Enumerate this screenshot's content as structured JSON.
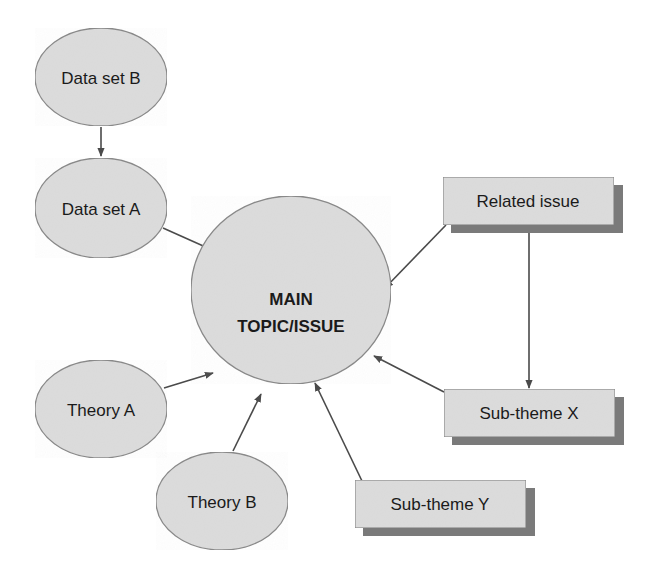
{
  "diagram": {
    "type": "concept-map",
    "colors": {
      "node_fill": "#dcdcdc",
      "node_stroke": "#8a8a8a",
      "shadow": "#7a7a7a",
      "arrow": "#4a4a4a",
      "text": "#1a1a1a"
    },
    "nodes": {
      "main": {
        "line1": "MAIN",
        "line2": "TOPIC/ISSUE",
        "shape": "ellipse"
      },
      "data_set_b": {
        "label": "Data set B",
        "shape": "ellipse"
      },
      "data_set_a": {
        "label": "Data set A",
        "shape": "ellipse"
      },
      "theory_a": {
        "label": "Theory A",
        "shape": "ellipse"
      },
      "theory_b": {
        "label": "Theory B",
        "shape": "ellipse"
      },
      "related_issue": {
        "label": "Related issue",
        "shape": "box"
      },
      "sub_theme_x": {
        "label": "Sub-theme X",
        "shape": "box"
      },
      "sub_theme_y": {
        "label": "Sub-theme Y",
        "shape": "box"
      }
    },
    "edges": [
      {
        "from": "Data set B",
        "to": "Data set A"
      },
      {
        "from": "Data set A",
        "to": "MAIN TOPIC/ISSUE"
      },
      {
        "from": "Related issue",
        "to": "MAIN TOPIC/ISSUE"
      },
      {
        "from": "Related issue",
        "to": "Sub-theme X"
      },
      {
        "from": "Sub-theme X",
        "to": "MAIN TOPIC/ISSUE"
      },
      {
        "from": "Sub-theme Y",
        "to": "MAIN TOPIC/ISSUE"
      },
      {
        "from": "Theory A",
        "to": "MAIN TOPIC/ISSUE"
      },
      {
        "from": "Theory B",
        "to": "MAIN TOPIC/ISSUE"
      }
    ]
  }
}
